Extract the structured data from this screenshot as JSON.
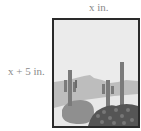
{
  "dimensions": {
    "width_label": "x in.",
    "height_label": "x + 5 in."
  },
  "picture": {
    "subject": "desert landscape with saguaro cacti",
    "colors": {
      "frame": "#2a2a2a",
      "sky": "#ebebeb",
      "mountains": "#bdbdbd",
      "ground": "#e6e6e6",
      "boulder": "#8f8f8f",
      "cactus": "#7a7a7a",
      "shrubs": "#555555"
    }
  }
}
